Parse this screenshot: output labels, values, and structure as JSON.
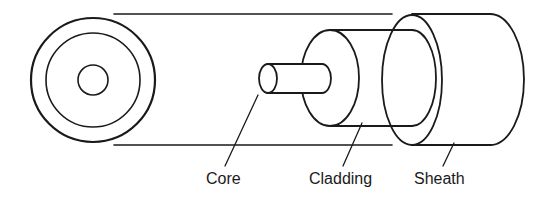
{
  "diagram": {
    "stroke_color": "#1a1a1a",
    "background": "#ffffff",
    "labels": {
      "core": "Core",
      "cladding": "Cladding",
      "sheath": "Sheath"
    }
  }
}
